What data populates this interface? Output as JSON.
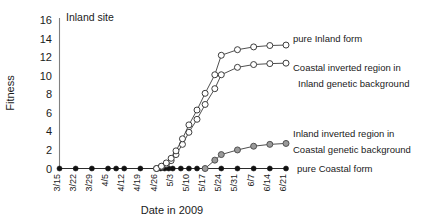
{
  "chart_data": {
    "type": "line",
    "title": "Inland site",
    "xlabel": "Date in 2009",
    "ylabel": "Fitness",
    "ylim": [
      0,
      16
    ],
    "ytick_step": 2,
    "yticks": [
      "0",
      "2",
      "4",
      "6",
      "8",
      "10",
      "12",
      "14",
      "16"
    ],
    "grid": false,
    "legend_position": "right-inline",
    "categories": [
      "3/15",
      "3/22",
      "3/29",
      "4/5",
      "4/12",
      "4/19",
      "4/26",
      "5/3",
      "5/10",
      "5/17",
      "5/24",
      "5/31",
      "6/7",
      "6/14",
      "6/21"
    ],
    "x": [
      0,
      1,
      2,
      3,
      4,
      5,
      6,
      7,
      8,
      9,
      10,
      11,
      12,
      13,
      14
    ],
    "series": [
      {
        "name": "pure Inland form",
        "marker": "open-circle",
        "color": "#333333",
        "marker_fill": "#ffffff",
        "x": [
          6.0,
          6.3,
          6.6,
          6.9,
          7.2,
          7.6,
          8.0,
          8.5,
          9.0,
          9.6,
          10.0,
          11.0,
          12.0,
          13.0,
          14.0
        ],
        "values": [
          0.0,
          0.25,
          0.6,
          1.1,
          1.9,
          3.2,
          4.7,
          6.3,
          8.1,
          10.1,
          12.2,
          12.8,
          13.1,
          13.25,
          13.3
        ]
      },
      {
        "name": "Coastal inverted region in Inland genetic background",
        "marker": "open-circle",
        "color": "#333333",
        "marker_fill": "#ffffff",
        "x": [
          6.0,
          6.3,
          6.6,
          6.9,
          7.2,
          7.6,
          8.0,
          8.5,
          9.0,
          9.6,
          10.0,
          11.0,
          12.0,
          13.0,
          14.0
        ],
        "values": [
          0.0,
          0.2,
          0.45,
          0.85,
          1.5,
          2.6,
          3.9,
          5.3,
          6.9,
          8.6,
          10.1,
          10.9,
          11.2,
          11.3,
          11.35
        ]
      },
      {
        "name": "Inland inverted region in Coastal genetic background",
        "marker": "gray-circle",
        "color": "#4a4a4a",
        "marker_fill": "#9a9a9a",
        "x": [
          9.0,
          9.6,
          10.0,
          11.0,
          12.0,
          13.0,
          14.0
        ],
        "values": [
          0.0,
          0.9,
          1.5,
          2.0,
          2.4,
          2.6,
          2.7
        ]
      },
      {
        "name": "pure Coastal form",
        "marker": "filled-circle",
        "color": "#1a1a1a",
        "marker_fill": "#111111",
        "x": [
          0,
          1,
          2,
          3,
          3.5,
          4,
          5,
          6,
          6.25,
          6.5,
          6.75,
          7,
          7.5,
          8,
          8.5,
          9,
          10,
          11,
          12,
          13,
          14
        ],
        "values": [
          0,
          0,
          0,
          0,
          0,
          0,
          0,
          0,
          0,
          0,
          0,
          0,
          0,
          0,
          0,
          0,
          0,
          0,
          0,
          0,
          0
        ]
      }
    ],
    "annotations": [
      {
        "id": "legend-pure-inland",
        "text": "pure Inland form"
      },
      {
        "id": "legend-coastal-inv-l1",
        "text": "Coastal inverted region in"
      },
      {
        "id": "legend-coastal-inv-l2",
        "text": "Inland genetic background"
      },
      {
        "id": "legend-inland-inv-l1",
        "text": "Inland inverted region in"
      },
      {
        "id": "legend-inland-inv-l2",
        "text": "Coastal genetic background"
      },
      {
        "id": "legend-pure-coastal",
        "text": "pure Coastal form"
      }
    ]
  },
  "labels": {
    "title": "Inland site",
    "ylabel": "Fitness",
    "xlabel": "Date in 2009",
    "yticks": [
      "16",
      "14",
      "12",
      "10",
      "8",
      "6",
      "4",
      "2",
      "0"
    ],
    "xticks": [
      "3/15",
      "3/22",
      "3/29",
      "4/5",
      "4/12",
      "4/19",
      "4/26",
      "5/3",
      "5/10",
      "5/17",
      "5/24",
      "5/31",
      "6/7",
      "6/14",
      "6/21"
    ],
    "legend": {
      "pure_inland": "pure Inland form",
      "coastal_inverted_line1": "Coastal inverted region in",
      "coastal_inverted_line2": "Inland genetic background",
      "inland_inverted_line1": "Inland inverted region in",
      "inland_inverted_line2": "Coastal genetic background",
      "pure_coastal": "pure Coastal form"
    }
  }
}
